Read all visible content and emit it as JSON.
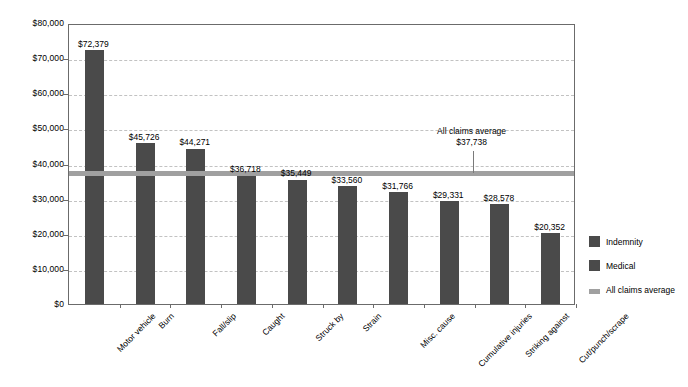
{
  "chart_data": {
    "type": "bar",
    "title": "",
    "xlabel": "",
    "ylabel": "",
    "ylim": [
      0,
      80000
    ],
    "grid": true,
    "legend_position": "right",
    "categories": [
      "Motor vehicle",
      "Burn",
      "Fall/slip",
      "Caught",
      "Struck by",
      "Strain",
      "Misc. cause",
      "Cumulative injuries",
      "Striking against",
      "Cut/punch/scrape"
    ],
    "values": [
      72379,
      45726,
      44271,
      36718,
      35449,
      33560,
      31766,
      29331,
      28578,
      20352
    ],
    "value_labels": [
      "$72,379",
      "$45,726",
      "$44,271",
      "$36,718",
      "$35,449",
      "$33,560",
      "$31,766",
      "$29,331",
      "$28,578",
      "$20,352"
    ],
    "y_ticks": [
      0,
      10000,
      20000,
      30000,
      40000,
      50000,
      60000,
      70000,
      80000
    ],
    "y_tick_labels": [
      "$0",
      "$10,000",
      "$20,000",
      "$30,000",
      "$40,000",
      "$50,000",
      "$60,000",
      "$70,000",
      "$80,000"
    ],
    "reference_line": {
      "value": 37738,
      "label": "All claims average",
      "value_label": "$37,738"
    },
    "series_colors": {
      "indemnity": "#4a4a4a",
      "medical": "#4a4a4a",
      "average_line": "#a0a0a0"
    }
  },
  "legend": {
    "items": [
      {
        "label": "Indemnity",
        "type": "swatch",
        "color": "#4a4a4a"
      },
      {
        "label": "Medical",
        "type": "swatch",
        "color": "#4a4a4a"
      },
      {
        "label": "All claims average",
        "type": "line",
        "color": "#a0a0a0"
      }
    ]
  },
  "annotation": {
    "line1": "All claims average",
    "line2": "$37,738"
  }
}
